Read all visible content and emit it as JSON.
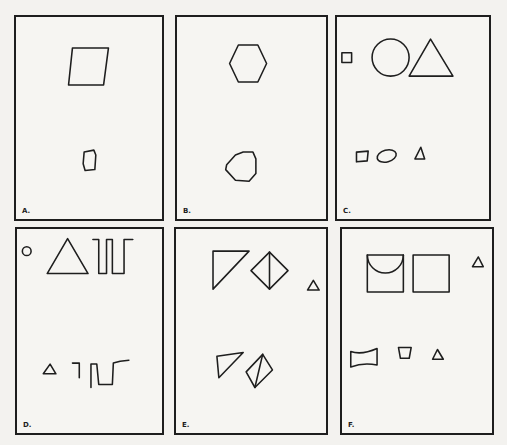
{
  "figure": {
    "panels": [
      {
        "id": "A",
        "label": "A.",
        "top_shapes": [
          "parallelogram"
        ],
        "bottom_shapes": [
          "small distorted quadrilateral"
        ]
      },
      {
        "id": "B",
        "label": "B.",
        "top_shapes": [
          "hexagon"
        ],
        "bottom_shapes": [
          "small distorted polygon"
        ]
      },
      {
        "id": "C",
        "label": "C.",
        "top_shapes": [
          "small square",
          "circle",
          "triangle"
        ],
        "bottom_shapes": [
          "small quadrilateral",
          "small ellipse",
          "small triangle"
        ]
      },
      {
        "id": "D",
        "label": "D.",
        "top_shapes": [
          "small circle",
          "triangle",
          "square-wave glyph"
        ],
        "bottom_shapes": [
          "small triangle",
          "distorted square-wave glyph"
        ]
      },
      {
        "id": "E",
        "label": "E.",
        "top_shapes": [
          "right triangle",
          "diamond with vertical line",
          "small triangle"
        ],
        "bottom_shapes": [
          "distorted triangle",
          "distorted diamond with line"
        ]
      },
      {
        "id": "F",
        "label": "F.",
        "top_shapes": [
          "square with semicircle",
          "square",
          "small triangle"
        ],
        "bottom_shapes": [
          "distorted rectangle",
          "small trapezoid",
          "small triangle"
        ]
      }
    ]
  }
}
